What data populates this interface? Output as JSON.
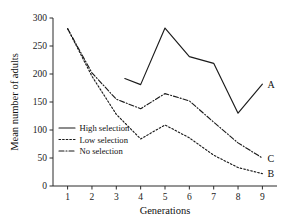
{
  "chart_data": {
    "type": "line",
    "title": "",
    "xlabel": "Generations",
    "ylabel": "Mean number of adults",
    "xlim": [
      0.4,
      9.6
    ],
    "ylim": [
      0,
      300
    ],
    "xticks": [
      1,
      2,
      3,
      4,
      5,
      6,
      7,
      8,
      9
    ],
    "yticks": [
      0,
      50,
      100,
      150,
      200,
      250,
      300
    ],
    "grid": false,
    "legend_position": "lower-left-inside",
    "series": [
      {
        "name": "High selection",
        "label": "A",
        "style": "solid",
        "x": [
          3.35,
          4,
          5,
          6,
          7,
          8,
          9
        ],
        "values": [
          192,
          181,
          282,
          231,
          219,
          130,
          182
        ]
      },
      {
        "name": "Low selection",
        "label": "B",
        "style": "dotted",
        "x": [
          1,
          2,
          3,
          4,
          5,
          6,
          7,
          8,
          9
        ],
        "values": [
          281,
          196,
          128,
          84,
          109,
          86,
          55,
          33,
          22
        ]
      },
      {
        "name": "No selection",
        "label": "C",
        "style": "dash-dot",
        "x": [
          1,
          2,
          3,
          4,
          5,
          6,
          7,
          8,
          9
        ],
        "values": [
          281,
          202,
          155,
          138,
          165,
          152,
          114,
          77,
          50
        ]
      }
    ],
    "annotations": [
      {
        "text": "A",
        "x": 9,
        "y": 182
      },
      {
        "text": "C",
        "x": 9,
        "y": 50
      },
      {
        "text": "B",
        "x": 9,
        "y": 22
      }
    ]
  },
  "axis": {
    "y_ticklabels": [
      "300",
      "250",
      "200",
      "150",
      "100",
      "50",
      "0"
    ],
    "x_ticklabels": [
      "1",
      "2",
      "3",
      "4",
      "5",
      "6",
      "7",
      "8",
      "9"
    ],
    "ylabel": "Mean number of adults",
    "xlabel": "Generations"
  },
  "legend": {
    "items": [
      {
        "label": "High selection",
        "style": "solid"
      },
      {
        "label": "Low selection",
        "style": "dotted"
      },
      {
        "label": "No selection",
        "style": "dash-dot"
      }
    ]
  },
  "curve_labels": {
    "a": "A",
    "b": "B",
    "c": "C"
  },
  "colors": {
    "ink": "#1b1b1b",
    "background": "#ffffff"
  }
}
